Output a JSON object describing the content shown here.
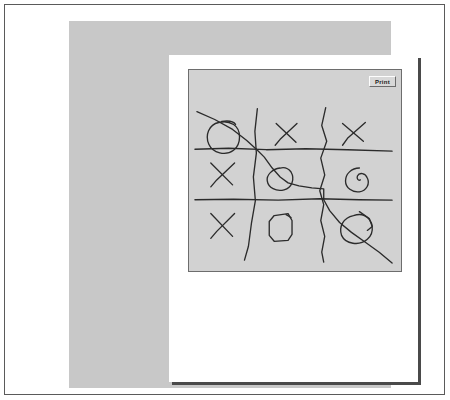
{
  "window": {
    "background_color": "#ffffff",
    "frame_border_color": "#5a5a5a"
  },
  "backdrop": {
    "color": "#c8c8c8"
  },
  "document": {
    "page_color": "#ffffff",
    "shadow_color": "#4a4a4a"
  },
  "canvas": {
    "background_color": "#d2d2d2",
    "border_color": "#6d6d6d",
    "ink_color": "#2b2b2b",
    "title": ""
  },
  "toolbar": {
    "print_label": "Print"
  },
  "board": {
    "description": "hand-drawn tic-tac-toe grid",
    "rows": [
      [
        "O",
        "X",
        "X"
      ],
      [
        "X",
        "O",
        "O"
      ],
      [
        "X",
        "O",
        "O"
      ]
    ],
    "grid_lines": {
      "horizontal": 2,
      "vertical": 2
    },
    "extra_strokes": "diagonal scribble crossing from top-left through center to bottom-right"
  }
}
